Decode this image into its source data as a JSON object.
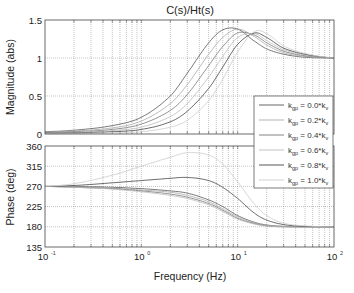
{
  "chart_data": [
    {
      "type": "line",
      "title": "C(s)/Ht(s)",
      "xlabel": "",
      "ylabel": "Magnitude (abs)",
      "xscale": "log",
      "xlim": [
        0.1,
        100
      ],
      "ylim": [
        0,
        1.5
      ],
      "yticks": [
        0,
        0.5,
        1,
        1.5
      ],
      "ytick_labels": [
        "0",
        "0.5",
        "1",
        "1.5"
      ],
      "grid": true,
      "legend_placement": "bottom-right",
      "x": [
        0.1,
        0.2,
        0.5,
        1,
        2,
        3,
        5,
        7,
        10,
        15,
        20,
        30,
        50,
        100
      ],
      "series": [
        {
          "name": "k_gp = 0.0*k_v",
          "values": [
            0.03,
            0.05,
            0.11,
            0.22,
            0.5,
            0.8,
            1.2,
            1.37,
            1.38,
            1.22,
            1.12,
            1.05,
            1.01,
            1.0
          ]
        },
        {
          "name": "k_gp = 0.2*k_v",
          "values": [
            0.025,
            0.04,
            0.08,
            0.17,
            0.4,
            0.65,
            1.05,
            1.27,
            1.38,
            1.28,
            1.17,
            1.07,
            1.02,
            1.0
          ]
        },
        {
          "name": "k_gp = 0.4*k_v",
          "values": [
            0.02,
            0.03,
            0.06,
            0.13,
            0.31,
            0.52,
            0.9,
            1.15,
            1.33,
            1.3,
            1.2,
            1.09,
            1.03,
            1.0
          ]
        },
        {
          "name": "k_gp = 0.6*k_v",
          "values": [
            0.015,
            0.02,
            0.045,
            0.09,
            0.23,
            0.4,
            0.75,
            1.02,
            1.27,
            1.32,
            1.23,
            1.11,
            1.04,
            1.0
          ]
        },
        {
          "name": "k_gp = 0.8*k_v",
          "values": [
            0.01,
            0.015,
            0.03,
            0.06,
            0.16,
            0.3,
            0.6,
            0.88,
            1.18,
            1.33,
            1.27,
            1.13,
            1.05,
            1.0
          ]
        },
        {
          "name": "k_gp = 1.0*k_v",
          "values": [
            0.005,
            0.008,
            0.015,
            0.03,
            0.09,
            0.18,
            0.44,
            0.72,
            1.08,
            1.35,
            1.32,
            1.16,
            1.06,
            1.0
          ]
        }
      ]
    },
    {
      "type": "line",
      "title": "",
      "xlabel": "Frequency  (Hz)",
      "ylabel": "Phase (deg)",
      "xscale": "log",
      "xlim": [
        0.1,
        100
      ],
      "ylim": [
        135,
        360
      ],
      "yticks": [
        135,
        180,
        225,
        270,
        315,
        360
      ],
      "ytick_labels": [
        "135",
        "180",
        "225",
        "270",
        "315",
        "360"
      ],
      "xticks": [
        0.1,
        1,
        10,
        100
      ],
      "xtick_labels": [
        [
          "10",
          "-1"
        ],
        [
          "10",
          "0"
        ],
        [
          "10",
          "1"
        ],
        [
          "10",
          "2"
        ]
      ],
      "grid": true,
      "x": [
        0.1,
        0.2,
        0.5,
        1,
        2,
        3,
        5,
        7,
        10,
        15,
        20,
        30,
        50,
        100
      ],
      "series": [
        {
          "name": "k_gp = 0.0*k_v",
          "values": [
            270,
            270,
            268,
            265,
            260,
            255,
            240,
            225,
            205,
            190,
            184,
            181,
            180,
            180
          ]
        },
        {
          "name": "k_gp = 0.2*k_v",
          "values": [
            270,
            269,
            266,
            262,
            257,
            250,
            236,
            220,
            202,
            188,
            183,
            181,
            180,
            180
          ]
        },
        {
          "name": "k_gp = 0.4*k_v",
          "values": [
            270,
            268,
            265,
            260,
            253,
            246,
            232,
            217,
            199,
            187,
            182,
            180,
            180,
            180
          ]
        },
        {
          "name": "k_gp = 0.6*k_v",
          "values": [
            270,
            268,
            264,
            258,
            250,
            243,
            229,
            214,
            197,
            186,
            182,
            180,
            180,
            180
          ]
        },
        {
          "name": "k_gp = 0.8*k_v",
          "values": [
            270,
            272,
            278,
            283,
            288,
            290,
            283,
            268,
            243,
            210,
            195,
            185,
            181,
            180
          ]
        },
        {
          "name": "k_gp = 1.0*k_v",
          "values": [
            270,
            276,
            295,
            315,
            335,
            345,
            340,
            320,
            280,
            230,
            205,
            188,
            182,
            180
          ]
        }
      ]
    }
  ],
  "legend": {
    "entries": [
      {
        "prefix": "k",
        "sub": "gp",
        "mid": " = 0.0*k",
        "sub2": "v"
      },
      {
        "prefix": "k",
        "sub": "gp",
        "mid": " = 0.2*k",
        "sub2": "v"
      },
      {
        "prefix": "k",
        "sub": "gp",
        "mid": " = 0.4*k",
        "sub2": "v"
      },
      {
        "prefix": "k",
        "sub": "gp",
        "mid": " = 0.6*k",
        "sub2": "v"
      },
      {
        "prefix": "k",
        "sub": "gp",
        "mid": " = 0.8*k",
        "sub2": "v"
      },
      {
        "prefix": "k",
        "sub": "gp",
        "mid": " = 1.0*k",
        "sub2": "v"
      }
    ]
  },
  "colors": {
    "series": [
      "#555555",
      "#aaaaaa",
      "#777777",
      "#bbbbbb",
      "#444444",
      "#cccccc"
    ],
    "grid": "#888888",
    "axis": "#444444"
  }
}
